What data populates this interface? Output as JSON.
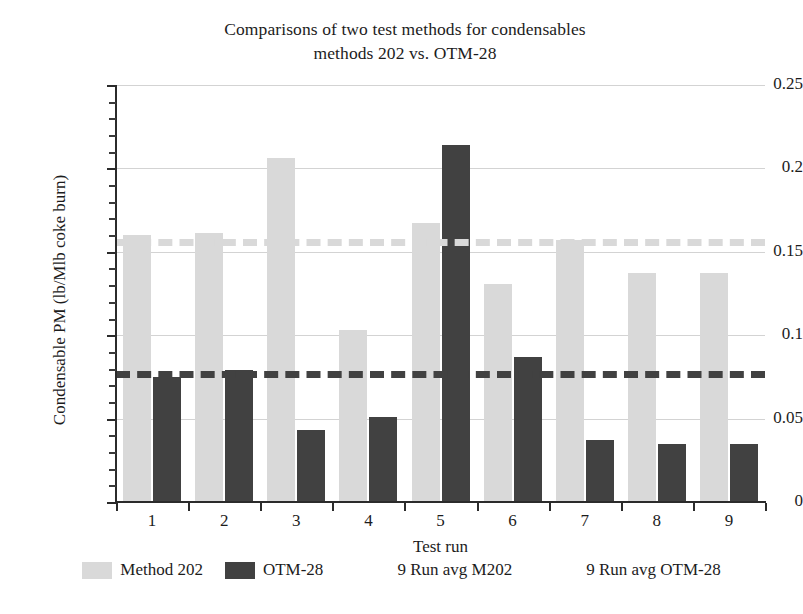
{
  "chart_data": {
    "type": "bar",
    "title": "Comparisons of two test methods for condensables methods 202 vs. OTM-28",
    "title_line1": "Comparisons of two test methods for condensables",
    "title_line2": "methods 202 vs. OTM-28",
    "xlabel": "Test run",
    "ylabel": "Condensable PM (lb/Mlb coke burn)",
    "ylim": [
      0,
      0.25
    ],
    "ytick_labels": [
      "0",
      "0.05",
      "0.1",
      "0.15",
      "0.2",
      "0.25"
    ],
    "ytick_values": [
      0,
      0.05,
      0.1,
      0.15,
      0.2,
      0.25
    ],
    "yminor_step": 0.01,
    "grid": "horizontal",
    "legend_position": "bottom",
    "categories": [
      "1",
      "2",
      "3",
      "4",
      "5",
      "6",
      "7",
      "8",
      "9"
    ],
    "series": [
      {
        "name": "Method 202",
        "color": "#d9d9d9",
        "values": [
          0.16,
          0.161,
          0.206,
          0.103,
          0.167,
          0.131,
          0.157,
          0.137,
          0.137
        ]
      },
      {
        "name": "OTM-28",
        "color": "#414141",
        "values": [
          0.075,
          0.079,
          0.043,
          0.051,
          0.214,
          0.087,
          0.037,
          0.035,
          0.035
        ]
      }
    ],
    "reference_lines": [
      {
        "name": "9 Run avg M202",
        "color": "#d9d9d9",
        "style": "dashed",
        "value": 0.156
      },
      {
        "name": "9 Run avg OTM-28",
        "color": "#414141",
        "style": "dashed",
        "value": 0.0765
      }
    ],
    "legend": [
      {
        "label": "Method 202",
        "kind": "bar",
        "color": "#d9d9d9"
      },
      {
        "label": "OTM-28",
        "kind": "bar",
        "color": "#414141"
      },
      {
        "label": "9 Run avg M202",
        "kind": "dashed-line",
        "color": "#d9d9d9"
      },
      {
        "label": "9 Run avg OTM-28",
        "kind": "dashed-line",
        "color": "#414141"
      }
    ]
  }
}
